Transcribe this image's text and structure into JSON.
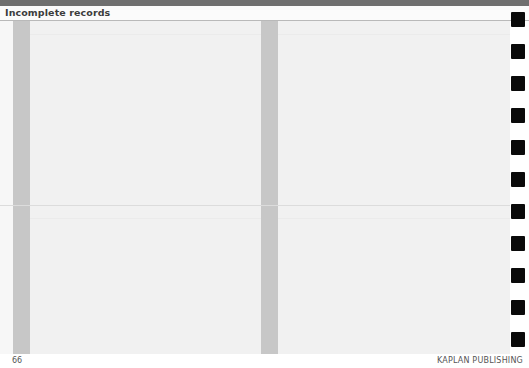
{
  "header": {
    "chapter_title": "Incomplete records"
  },
  "footer": {
    "page_number": "66",
    "publisher": "KAPLAN PUBLISHING"
  },
  "layout": {
    "columns": 2,
    "grey_bar_positions_px": [
      13,
      261
    ],
    "horizontal_divider_y_px": 205,
    "tab_marker_count": 11,
    "tab_marker_y_px": [
      12,
      44,
      76,
      108,
      140,
      172,
      204,
      236,
      268,
      300,
      332
    ]
  },
  "colors": {
    "top_band": "#6f6f6f",
    "page_body": "#f1f1f1",
    "grey_bar": "#c7c7c7",
    "tab_marker": "#0a0a0a",
    "text": "#3c3c3c"
  }
}
